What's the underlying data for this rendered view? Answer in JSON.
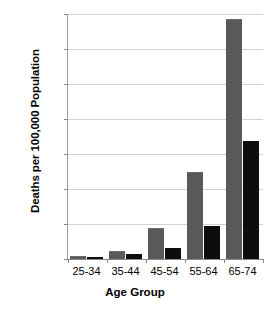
{
  "chart_data": {
    "type": "bar",
    "title": "",
    "xlabel": "Age Group",
    "ylabel": "Deaths per 100,000 Population",
    "categories": [
      "25-34",
      "35-44",
      "45-54",
      "55-64",
      "65-74"
    ],
    "series": [
      {
        "name": "series-1",
        "color": "#595959",
        "values": [
          8,
          22,
          88,
          250,
          685
        ]
      },
      {
        "name": "series-2",
        "color": "#0d0d0d",
        "values": [
          7,
          14,
          32,
          95,
          338
        ]
      }
    ],
    "ylim": [
      0,
      700
    ],
    "y_ticks": [
      0,
      100,
      200,
      300,
      400,
      500,
      600,
      700
    ],
    "y_tick_labels": [
      "0",
      "100",
      "200",
      "300",
      "400",
      "500",
      "600",
      "700"
    ],
    "grid": true,
    "legend": false,
    "legend_position": "none",
    "colors": {
      "series_gray": "#595959",
      "series_black": "#0d0d0d",
      "gridline": "#d2d2d2",
      "axis": "#8a8a8a",
      "background": "#ffffff",
      "text": "#000000"
    }
  }
}
